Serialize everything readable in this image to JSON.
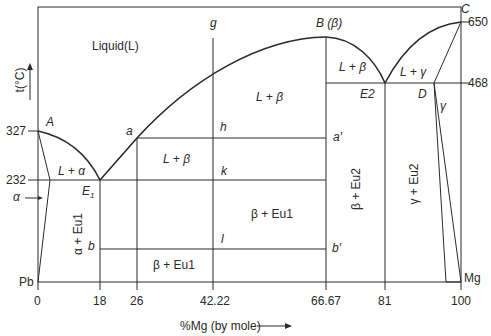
{
  "diagram": {
    "y_axis_label": "t(°C)",
    "x_axis_label": "%Mg (by mole)",
    "x_ticks": [
      "0",
      "18",
      "26",
      "42.22",
      "66.67",
      "81",
      "100"
    ],
    "y_ticks_left": [
      "327",
      "232"
    ],
    "y_ticks_right": [
      "650",
      "468"
    ],
    "end_labels": {
      "left": "Pb",
      "right": "Mg"
    },
    "points": {
      "A": "A",
      "B": "B (β)",
      "C": "C",
      "D": "D",
      "E1": "E",
      "E1_sub": "1",
      "E2": "E2",
      "a": "a",
      "a_prime": "a′",
      "b": "b",
      "b_prime": "b′",
      "g": "g",
      "h": "h",
      "k": "k",
      "l": "l"
    },
    "regions": {
      "liquid": "Liquid(L)",
      "l_beta_upper": "L + β",
      "l_beta_right": "L + β",
      "l_beta_lower": "L + β",
      "l_alpha": "L + α",
      "l_gamma": "L + γ",
      "gamma": "γ",
      "alpha": "α",
      "alpha_eu1": "α + Eu1",
      "beta_eu1_mid": "β + Eu1",
      "beta_eu1_low": "β + Eu1",
      "beta_eu2": "β + Eu2",
      "gamma_eu2": "γ + Eu2"
    },
    "colors": {
      "line": "#2a2a2a",
      "background": "#ffffff"
    }
  }
}
